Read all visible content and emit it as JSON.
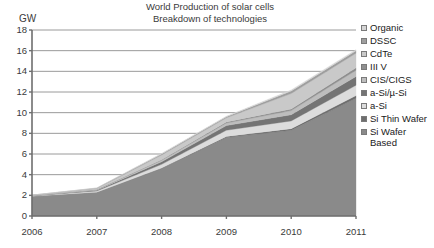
{
  "chart_data": {
    "type": "area",
    "stacked": true,
    "title": "World Production of solar cells",
    "subtitle": "Breakdown of technologies",
    "xlabel": "",
    "ylabel": "GW",
    "x": [
      2006,
      2007,
      2008,
      2009,
      2010,
      2011
    ],
    "categories": [
      "2006",
      "2007",
      "2008",
      "2009",
      "2010",
      "2011"
    ],
    "xtick_labels": [
      "2006",
      "2007",
      "2008",
      "2009",
      "2010",
      "2011"
    ],
    "ytick_labels": [
      "0",
      "2",
      "4",
      "6",
      "8",
      "10",
      "12",
      "14",
      "16",
      "18"
    ],
    "ylim": [
      0,
      18
    ],
    "ytick_step": 2,
    "grid": "horizontal",
    "legend_position": "right",
    "series": [
      {
        "name": "Si Wafer Based",
        "color": "#8a8a8a",
        "values": [
          1.9,
          2.3,
          4.6,
          7.6,
          8.3,
          11.4
        ]
      },
      {
        "name": "Si Thin Wafer",
        "color": "#6e6e6e",
        "values": [
          0.0,
          0.0,
          0.05,
          0.1,
          0.15,
          0.25
        ]
      },
      {
        "name": "a-Si",
        "color": "#dcdcdc",
        "values": [
          0.05,
          0.12,
          0.35,
          0.6,
          0.75,
          1.0
        ]
      },
      {
        "name": "a-Si/µ-Si",
        "color": "#747474",
        "values": [
          0.02,
          0.08,
          0.25,
          0.45,
          0.6,
          0.85
        ]
      },
      {
        "name": "CIS/CIGS",
        "color": "#bdbdbd",
        "values": [
          0.02,
          0.05,
          0.15,
          0.25,
          0.4,
          0.6
        ]
      },
      {
        "name": "III V",
        "color": "#8f8f8f",
        "values": [
          0.0,
          0.02,
          0.05,
          0.1,
          0.15,
          0.25
        ]
      },
      {
        "name": "CdTe",
        "color": "#c9c9c9",
        "values": [
          0.03,
          0.1,
          0.45,
          0.4,
          1.5,
          1.4
        ]
      },
      {
        "name": "DSSC",
        "color": "#9e9e9e",
        "values": [
          0.0,
          0.03,
          0.1,
          0.1,
          0.25,
          0.25
        ]
      },
      {
        "name": "Organic",
        "color": "#d5d5d5",
        "values": [
          0.0,
          0.02,
          0.05,
          0.05,
          0.1,
          0.1
        ]
      }
    ],
    "totals": [
      2.02,
      2.72,
      6.05,
      9.65,
      12.2,
      16.1
    ],
    "annotations": []
  },
  "legend": {
    "items": [
      {
        "label": "Organic",
        "color": "#d5d5d5"
      },
      {
        "label": "DSSC",
        "color": "#9e9e9e"
      },
      {
        "label": "CdTe",
        "color": "#c9c9c9"
      },
      {
        "label": "III V",
        "color": "#8f8f8f"
      },
      {
        "label": "CIS/CIGS",
        "color": "#bdbdbd"
      },
      {
        "label": "a-Si/µ-Si",
        "color": "#747474"
      },
      {
        "label": "a-Si",
        "color": "#dcdcdc"
      },
      {
        "label": "Si Thin Wafer",
        "color": "#6e6e6e"
      },
      {
        "label": "Si Wafer Based",
        "color": "#8a8a8a"
      }
    ]
  },
  "style": {
    "background": "#ffffff",
    "axis_color": "#6e6e6e",
    "grid_color": "#9a9a9a",
    "text_color": "#3a3a3a"
  }
}
